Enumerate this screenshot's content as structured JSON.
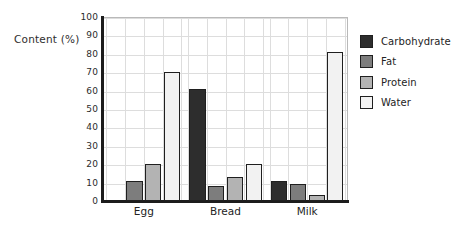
{
  "chart_data": {
    "type": "bar",
    "title": "",
    "xlabel": "",
    "ylabel": "Content (%)",
    "ylim": [
      0,
      100
    ],
    "ytick_step": 10,
    "yticks": [
      100,
      90,
      80,
      70,
      60,
      50,
      40,
      30,
      20,
      10,
      0
    ],
    "categories": [
      "Egg",
      "Bread",
      "Milk"
    ],
    "grid": true,
    "legend_position": "right",
    "series": [
      {
        "name": "Carbohydrate",
        "color": "#2d2d2d",
        "values": [
          0,
          61,
          11
        ]
      },
      {
        "name": "Fat",
        "color": "#7d7d7d",
        "values": [
          11,
          8,
          9
        ]
      },
      {
        "name": "Protein",
        "color": "#b3b3b3",
        "values": [
          20,
          13,
          3
        ]
      },
      {
        "name": "Water",
        "color": "#f2f2f2",
        "values": [
          70,
          20,
          81
        ]
      }
    ]
  },
  "legend": {
    "items": [
      {
        "label": "Carbohydrate",
        "color": "#2d2d2d"
      },
      {
        "label": "Fat",
        "color": "#7d7d7d"
      },
      {
        "label": "Protein",
        "color": "#b3b3b3"
      },
      {
        "label": "Water",
        "color": "#f2f2f2"
      }
    ]
  },
  "axis": {
    "y_title": "Content (%)"
  },
  "colors": {
    "axis_line": "#1c1c1c",
    "grid_line": "#dddddd",
    "bar_outline": "#1f1f1f",
    "background": "#ffffff",
    "text": "#232323"
  }
}
